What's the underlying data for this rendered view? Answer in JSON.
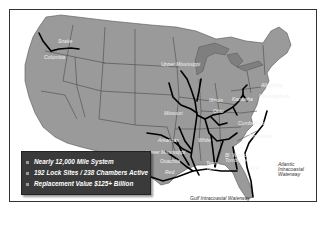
{
  "map": {
    "type": "US inland waterway system map",
    "colors": {
      "land": "#9a9a9a",
      "great_lakes": "#7f7f7f",
      "state_borders": "#4a4a4a",
      "waterways": "#000000",
      "ocean": "#ffffff",
      "infobox_bg": "#3a3a3a"
    },
    "labels": {
      "snake": "Snake",
      "columbia": "Columbia",
      "upper_mississippi": "Upper Mississippi",
      "illinois": "Illinois",
      "missouri": "Missouri",
      "ohio": "Ohio",
      "kanawha": "Kanawha",
      "allegheny": "Allegheny",
      "monongahela": "Monongahela",
      "cumberland": "Cumberland",
      "tennessee": "Tennessee",
      "arkansas": "Arkansas",
      "white": "White",
      "lower_mississippi": "Lower Mississippi",
      "ouachita": "Ouachita",
      "red": "Red",
      "tenn_tom": "Tenn-Tom",
      "black_warrior": "Bl. Warrior Tombigbee",
      "acf": "ACF",
      "gulf_iww": "Gulf Intracoastal Waterway",
      "atlantic_iww": "Atlantic Intracoastal Waterway"
    }
  },
  "infobox": {
    "items": [
      "Nearly 12,000 Mile System",
      "192 Lock Sites / 238 Chambers Active",
      "Replacement Value  $125+ Billion"
    ]
  }
}
